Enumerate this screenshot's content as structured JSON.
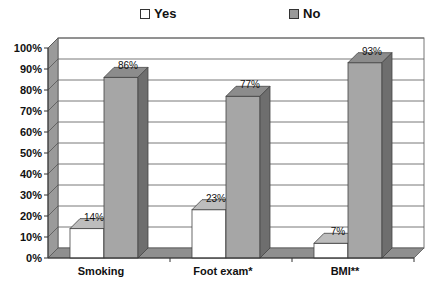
{
  "chart_data": {
    "type": "bar",
    "style": "3d-clustered-column",
    "title": "",
    "xlabel": "",
    "ylabel": "",
    "categories": [
      "Smoking",
      "Foot exam*",
      "BMI**"
    ],
    "series": [
      {
        "name": "Yes",
        "values": [
          14,
          23,
          7
        ],
        "color": "#ffffff"
      },
      {
        "name": "No",
        "values": [
          86,
          77,
          93
        ],
        "color": "#a8a8a8"
      }
    ],
    "data_labels": {
      "Yes": [
        "14%",
        "23%",
        "7%"
      ],
      "No": [
        "86%",
        "77%",
        "93%"
      ]
    },
    "ylim": [
      0,
      100
    ],
    "y_ticks": [
      "0%",
      "10%",
      "20%",
      "30%",
      "40%",
      "50%",
      "60%",
      "70%",
      "80%",
      "90%",
      "100%"
    ],
    "grid": true,
    "legend_position": "top"
  },
  "legend": {
    "items": [
      {
        "label": "Yes",
        "color": "#ffffff"
      },
      {
        "label": "No",
        "color": "#a8a8a8"
      }
    ]
  },
  "colors": {
    "no_front": "#a6a6a6",
    "no_top": "#8c8c8c",
    "no_side": "#6e6e6e",
    "yes_front": "#ffffff",
    "yes_top": "#bdbdbd",
    "yes_side": "#e0e0e0",
    "wall": "#ffffff",
    "side_wall": "#9a9a9a",
    "floor": "#8f8f8f",
    "grid": "#555555"
  }
}
